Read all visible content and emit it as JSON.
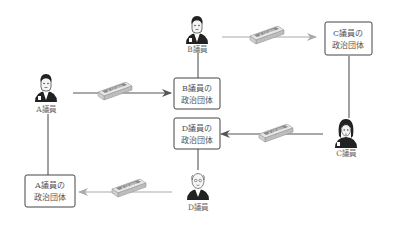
{
  "diagram": {
    "persons": {
      "a": {
        "label": "A議員"
      },
      "b": {
        "label": "B議員"
      },
      "c": {
        "label": "C議員"
      },
      "d": {
        "label": "D議員"
      }
    },
    "boxes": {
      "a": {
        "line1": "A議員の",
        "line2": "政治団体"
      },
      "b": {
        "line1": "B議員の",
        "line2": "政治団体"
      },
      "c": {
        "line1": "C議員の",
        "line2": "政治団体"
      },
      "d": {
        "line1": "D議員の",
        "line2": "政治団体"
      }
    },
    "money_label": "¥10,000",
    "colors": {
      "dark_arrow": "#555555",
      "light_arrow": "#aaaaaa",
      "box_border": "#444444",
      "line": "#444444"
    },
    "flows": [
      {
        "from": "A議員",
        "to": "B議員の政治団体"
      },
      {
        "from": "B議員",
        "to": "C議員の政治団体"
      },
      {
        "from": "C議員",
        "to": "D議員の政治団体"
      },
      {
        "from": "D議員",
        "to": "A議員の政治団体"
      }
    ]
  }
}
